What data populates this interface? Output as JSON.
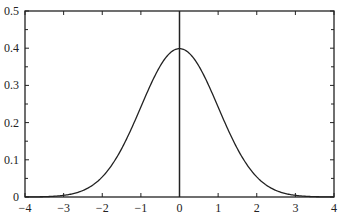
{
  "chart_data": {
    "type": "line",
    "title": "",
    "xlabel": "",
    "ylabel": "",
    "xlim": [
      -4,
      4
    ],
    "ylim": [
      0,
      0.5
    ],
    "grid": false,
    "legend": null,
    "x_ticks": [
      -4,
      -3,
      -2,
      -1,
      0,
      1,
      2,
      3,
      4
    ],
    "x_tick_labels": [
      "−4",
      "−3",
      "−2",
      "−1",
      "0",
      "1",
      "2",
      "3",
      "4"
    ],
    "y_ticks": [
      0,
      0.1,
      0.2,
      0.3,
      0.4,
      0.5
    ],
    "y_tick_labels": [
      "0",
      "0.1",
      "0.2",
      "0.3",
      "0.4",
      "0.5"
    ],
    "annotations": [
      {
        "type": "vertical_line",
        "x": 0,
        "description": "mean line at x = 0"
      }
    ],
    "series": [
      {
        "name": "Standard normal density",
        "color": "#222222",
        "x": [
          -4,
          -3.5,
          -3,
          -2.5,
          -2,
          -1.5,
          -1,
          -0.5,
          0,
          0.5,
          1,
          1.5,
          2,
          2.5,
          3,
          3.5,
          4
        ],
        "values": [
          0.0001,
          0.0009,
          0.0044,
          0.0175,
          0.054,
          0.1295,
          0.242,
          0.3521,
          0.3989,
          0.3521,
          0.242,
          0.1295,
          0.054,
          0.0175,
          0.0044,
          0.0009,
          0.0001
        ]
      }
    ]
  }
}
